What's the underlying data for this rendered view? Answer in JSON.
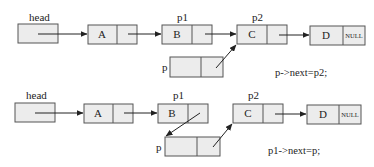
{
  "diagram": {
    "steps": [
      {
        "step": 1,
        "pointer_labels": {
          "head": "head",
          "p1": "p1",
          "p2": "p2",
          "p": "p"
        },
        "nodes": [
          {
            "id": "A",
            "value": "A"
          },
          {
            "id": "B",
            "value": "B"
          },
          {
            "id": "C",
            "value": "C"
          },
          {
            "id": "D",
            "value": "D",
            "next": "NULL"
          }
        ],
        "new_node": {
          "id": "p",
          "value": ""
        },
        "code": "p->next=p2;"
      },
      {
        "step": 2,
        "pointer_labels": {
          "head": "head",
          "p1": "p1",
          "p2": "p2",
          "p": "p"
        },
        "nodes": [
          {
            "id": "A",
            "value": "A"
          },
          {
            "id": "B",
            "value": "B"
          },
          {
            "id": "C",
            "value": "C"
          },
          {
            "id": "D",
            "value": "D",
            "next": "NULL"
          }
        ],
        "new_node": {
          "id": "p",
          "value": ""
        },
        "code": "p1->next=p;"
      }
    ],
    "colors": {
      "node_fill": "#ececec",
      "stroke": "#555555",
      "text": "#222222"
    }
  }
}
